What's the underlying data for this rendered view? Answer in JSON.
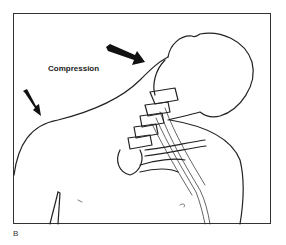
{
  "figure": {
    "annotation": "Compression",
    "panel_label": "B",
    "stroke_color": "#222222",
    "background_color": "#ffffff",
    "arrows": [
      {
        "name": "neck-arrow",
        "from": [
          107,
          48
        ],
        "to": [
          143,
          62
        ]
      },
      {
        "name": "shoulder-arrow",
        "from": [
          24,
          90
        ],
        "to": [
          40,
          115
        ]
      }
    ]
  }
}
